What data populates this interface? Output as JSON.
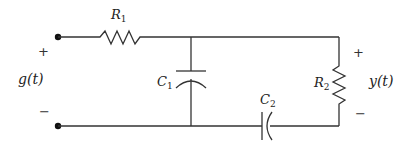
{
  "diagram": {
    "type": "circuit",
    "components": [
      {
        "id": "R1",
        "kind": "resistor",
        "label": "R",
        "sub": "1"
      },
      {
        "id": "C1",
        "kind": "capacitor",
        "label": "C",
        "sub": "1"
      },
      {
        "id": "C2",
        "kind": "capacitor",
        "label": "C",
        "sub": "2"
      },
      {
        "id": "R2",
        "kind": "resistor",
        "label": "R",
        "sub": "2"
      }
    ],
    "input": {
      "label": "g(t)",
      "plus": "+",
      "minus": "−"
    },
    "output": {
      "label": "y(t)",
      "plus": "+",
      "minus": "−"
    },
    "colors": {
      "stroke": "#333333",
      "background": "#ffffff"
    }
  }
}
